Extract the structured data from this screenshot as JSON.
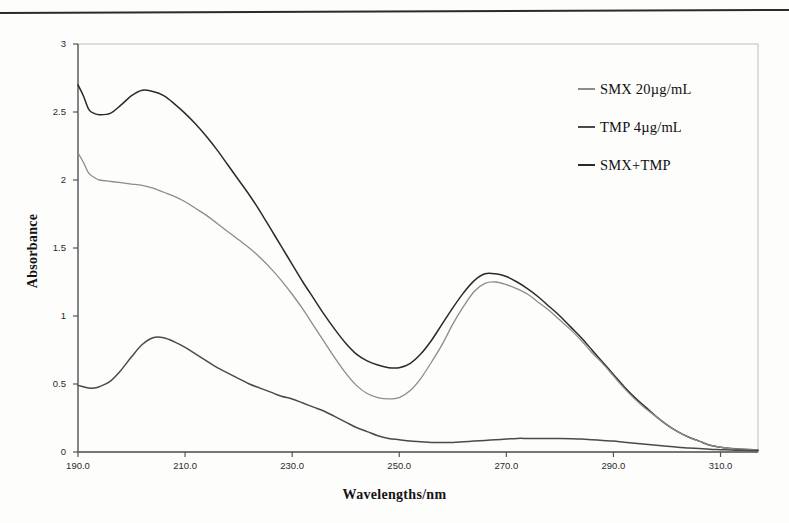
{
  "figure": {
    "y_axis_title": "Absorbance",
    "x_axis_title": "Wavelengths/nm"
  },
  "legend": {
    "items": [
      {
        "label": "SMX 20",
        "unit": "µg/mL",
        "color": "#8c8c8c"
      },
      {
        "label": "TMP 4",
        "unit": "µg/mL",
        "color": "#4a4a4a"
      },
      {
        "label": "SMX+TMP",
        "unit": "",
        "color": "#2a2a2a"
      }
    ]
  },
  "chart_data": {
    "type": "line",
    "title": "",
    "xlabel": "Wavelengths/nm",
    "ylabel": "Absorbance",
    "xlim": [
      190.0,
      317.0
    ],
    "ylim": [
      0,
      3
    ],
    "xticks": [
      "190.0",
      "210.0",
      "230.0",
      "250.0",
      "270.0",
      "290.0",
      "310.0"
    ],
    "xtick_values": [
      190.0,
      210.0,
      230.0,
      250.0,
      270.0,
      290.0,
      310.0
    ],
    "yticks": [
      "0",
      "0.5",
      "1",
      "1.5",
      "2",
      "2.5",
      "3"
    ],
    "ytick_values": [
      0,
      0.5,
      1,
      1.5,
      2,
      2.5,
      3
    ],
    "grid": false,
    "legend_position": "upper-right",
    "x": [
      190,
      191,
      192,
      193,
      194,
      196,
      198,
      200,
      202,
      204,
      206,
      208,
      210,
      212,
      214,
      216,
      218,
      220,
      222,
      224,
      226,
      228,
      230,
      232,
      234,
      236,
      238,
      240,
      242,
      244,
      246,
      248,
      250,
      252,
      254,
      256,
      258,
      260,
      262,
      264,
      266,
      268,
      270,
      272,
      274,
      276,
      278,
      280,
      282,
      284,
      286,
      288,
      290,
      292,
      294,
      296,
      298,
      300,
      302,
      304,
      306,
      308,
      310,
      312,
      314,
      317
    ],
    "series": [
      {
        "name": "SMX+TMP",
        "color": "#2a2a2a",
        "values": [
          2.7,
          2.62,
          2.52,
          2.49,
          2.48,
          2.49,
          2.55,
          2.62,
          2.66,
          2.65,
          2.62,
          2.56,
          2.49,
          2.41,
          2.32,
          2.22,
          2.11,
          2.0,
          1.89,
          1.77,
          1.64,
          1.51,
          1.38,
          1.25,
          1.13,
          1.01,
          0.9,
          0.8,
          0.72,
          0.67,
          0.64,
          0.62,
          0.62,
          0.65,
          0.72,
          0.82,
          0.94,
          1.06,
          1.17,
          1.26,
          1.31,
          1.31,
          1.29,
          1.25,
          1.2,
          1.14,
          1.07,
          1.0,
          0.92,
          0.84,
          0.75,
          0.66,
          0.57,
          0.48,
          0.4,
          0.33,
          0.26,
          0.2,
          0.15,
          0.11,
          0.08,
          0.05,
          0.035,
          0.025,
          0.02,
          0.015
        ]
      },
      {
        "name": "SMX 20 µg/mL",
        "color": "#8c8c8c",
        "values": [
          2.2,
          2.13,
          2.05,
          2.02,
          2.0,
          1.99,
          1.98,
          1.97,
          1.96,
          1.94,
          1.91,
          1.88,
          1.84,
          1.79,
          1.74,
          1.68,
          1.62,
          1.56,
          1.5,
          1.43,
          1.35,
          1.26,
          1.16,
          1.05,
          0.93,
          0.81,
          0.69,
          0.58,
          0.49,
          0.43,
          0.4,
          0.39,
          0.4,
          0.45,
          0.54,
          0.66,
          0.79,
          0.94,
          1.07,
          1.18,
          1.24,
          1.25,
          1.23,
          1.2,
          1.16,
          1.1,
          1.04,
          0.97,
          0.9,
          0.82,
          0.73,
          0.65,
          0.56,
          0.47,
          0.39,
          0.32,
          0.26,
          0.2,
          0.15,
          0.11,
          0.08,
          0.05,
          0.035,
          0.025,
          0.02,
          0.015
        ]
      },
      {
        "name": "TMP 4 µg/mL",
        "color": "#4a4a4a",
        "values": [
          0.49,
          0.48,
          0.47,
          0.47,
          0.48,
          0.52,
          0.6,
          0.7,
          0.79,
          0.84,
          0.84,
          0.81,
          0.77,
          0.72,
          0.67,
          0.62,
          0.58,
          0.54,
          0.5,
          0.47,
          0.44,
          0.41,
          0.39,
          0.36,
          0.33,
          0.3,
          0.26,
          0.22,
          0.18,
          0.15,
          0.12,
          0.1,
          0.09,
          0.08,
          0.075,
          0.07,
          0.07,
          0.07,
          0.075,
          0.08,
          0.085,
          0.09,
          0.095,
          0.1,
          0.1,
          0.1,
          0.1,
          0.1,
          0.098,
          0.095,
          0.09,
          0.085,
          0.08,
          0.072,
          0.065,
          0.057,
          0.05,
          0.042,
          0.035,
          0.03,
          0.025,
          0.02,
          0.017,
          0.014,
          0.012,
          0.01
        ]
      }
    ]
  }
}
